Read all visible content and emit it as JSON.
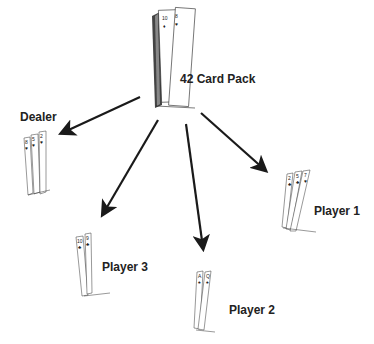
{
  "pack": {
    "label": "42 Card Pack",
    "top_cards": [
      "10♦",
      "8♥"
    ]
  },
  "hands": [
    {
      "name": "Dealer",
      "cards": [
        "8♥",
        "5♥",
        "2♥"
      ]
    },
    {
      "name": "Player 1",
      "cards": [
        "2♣",
        "5♣",
        "7♥"
      ]
    },
    {
      "name": "Player 2",
      "cards": [
        "A♠",
        "Q♠"
      ]
    },
    {
      "name": "Player 3",
      "cards": [
        "10♣",
        "9♣"
      ]
    }
  ],
  "colors": {
    "ink": "#222222",
    "arrow": "#1a1a1a"
  }
}
